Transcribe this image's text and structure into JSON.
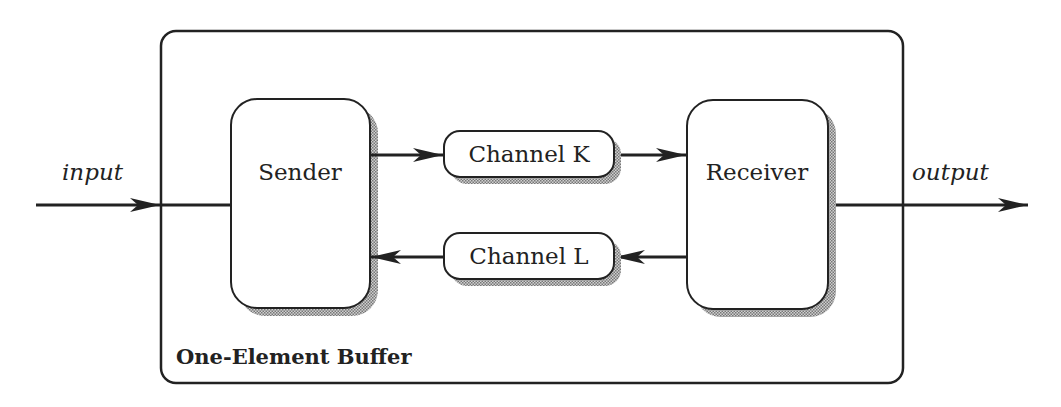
{
  "diagram": {
    "title": "One-Element Buffer",
    "input_label": "input",
    "output_label": "output",
    "nodes": {
      "sender": {
        "label": "Sender"
      },
      "receiver": {
        "label": "Receiver"
      },
      "channel_k": {
        "label": "Channel K"
      },
      "channel_l": {
        "label": "Channel L"
      }
    },
    "edges": [
      {
        "from": "input",
        "to": "sender"
      },
      {
        "from": "sender",
        "to": "channel_k"
      },
      {
        "from": "channel_k",
        "to": "receiver"
      },
      {
        "from": "receiver",
        "to": "channel_l"
      },
      {
        "from": "channel_l",
        "to": "sender"
      },
      {
        "from": "receiver",
        "to": "output"
      }
    ],
    "colors": {
      "stroke": "#222222",
      "shadow": "#9a9a9a",
      "fill": "#ffffff"
    }
  }
}
